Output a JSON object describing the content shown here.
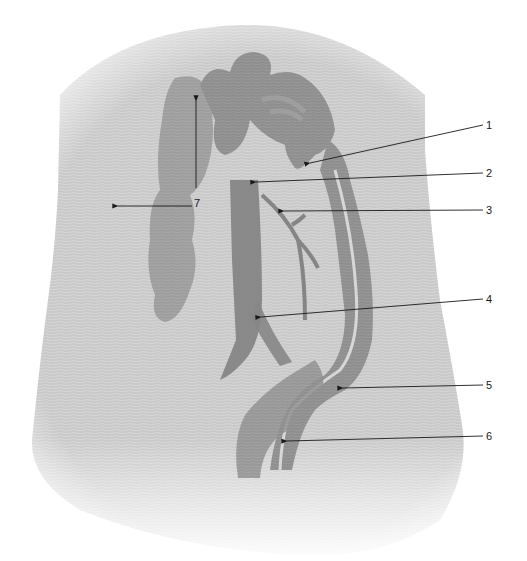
{
  "figure": {
    "colors": {
      "background": "#ffffff",
      "body": "#c9c9c9",
      "organ": "#8f8f8f",
      "organ_dark": "#7a7a7a",
      "vessel": "#868686",
      "leader": "#1a1a1a"
    }
  },
  "labels": [
    {
      "id": "1",
      "text": "1"
    },
    {
      "id": "2",
      "text": "2"
    },
    {
      "id": "3",
      "text": "3"
    },
    {
      "id": "4",
      "text": "4"
    },
    {
      "id": "5",
      "text": "5"
    },
    {
      "id": "6",
      "text": "6"
    },
    {
      "id": "7",
      "text": "7"
    }
  ]
}
